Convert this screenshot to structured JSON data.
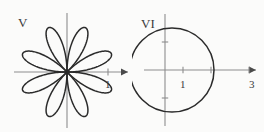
{
  "figure": {
    "background_color": "#fbfbfa",
    "curve_color": "#2b2b2b",
    "axis_color": "#8d8d8d",
    "label_color": "#3a3a3a",
    "panels": [
      {
        "id": "V",
        "label": "V",
        "curve_kind": "rose",
        "petal_count": 8,
        "petal_radius": 48,
        "petal_angle_offset_deg": 22.5,
        "center": {
          "x": 67,
          "y": 72
        },
        "axis": {
          "x_start": 14,
          "x_end": 128,
          "y_start": 13,
          "y_end": 128,
          "x_has_arrow": true,
          "y_has_arrow": false
        },
        "x_ticks": [
          {
            "value": 1,
            "label": "1",
            "px": 108
          }
        ],
        "y_ticks": []
      },
      {
        "id": "VI",
        "label": "VI",
        "curve_kind": "circle",
        "circle": {
          "center_x_value": 1.5,
          "radius_value": 1.5,
          "passes_through_origin": true,
          "rightmost_x_value": 3
        },
        "center": {
          "x": 40,
          "y": 70
        },
        "radius": 42,
        "origin": {
          "x": 33,
          "y": 70
        },
        "axis": {
          "x_start": 12,
          "x_end": 124,
          "y_start": 14,
          "y_end": 126,
          "x_has_arrow": true,
          "y_has_arrow": false
        },
        "x_ticks": [
          {
            "value": 1,
            "label": "1",
            "px": 51
          },
          {
            "value": 2,
            "label": "",
            "px": 79
          },
          {
            "value": 3,
            "label": "3",
            "px": 117
          }
        ],
        "y_ticks": [
          {
            "value": 1,
            "label": "",
            "px": 42
          },
          {
            "value": -1,
            "label": "",
            "px": 98
          }
        ]
      }
    ]
  },
  "chart_data": {
    "type": "line",
    "title": "",
    "xlabel": "",
    "ylabel": "",
    "plots": [
      {
        "name": "V",
        "description": "Eight-petaled rose curve in polar coordinates",
        "equation": "r = a cos(4(theta - pi/8))",
        "petals": 8,
        "tick_labels_x": [
          "1"
        ],
        "tick_labels_y": []
      },
      {
        "name": "VI",
        "description": "Circle through the origin with rightmost point at x = 3",
        "equation": "r = 3 cos(theta)",
        "center": [
          1.5,
          0
        ],
        "radius": 1.5,
        "tick_labels_x": [
          "1",
          "3"
        ],
        "tick_labels_y": []
      }
    ]
  }
}
